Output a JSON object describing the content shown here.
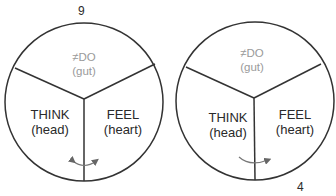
{
  "diagrams": [
    {
      "number": "9",
      "top": {
        "line1": "≠DO",
        "line2": "(gut)"
      },
      "left": {
        "line1": "THINK",
        "line2": "(head)"
      },
      "right": {
        "line1": "FEEL",
        "line2": "(heart)"
      },
      "arrow": "double-headed-curved-arrow"
    },
    {
      "number": "4",
      "top": {
        "line1": "≠DO",
        "line2": "(gut)"
      },
      "left": {
        "line1": "THINK",
        "line2": "(head)"
      },
      "right": {
        "line1": "FEEL",
        "line2": "(heart)"
      },
      "arrow": "curved-arrow-right"
    }
  ],
  "colors": {
    "line": "#333333",
    "muted_text": "#9a9a9a",
    "arrow": "#777777"
  }
}
